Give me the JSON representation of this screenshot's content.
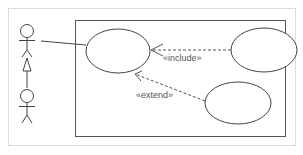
{
  "diagram": {
    "type": "uml-use-case",
    "colors": {
      "background": "#ffffff",
      "outer_frame": "#dcdcdc",
      "system_boundary": "#555555",
      "stroke": "#444444",
      "dashed": "#555555",
      "label_text": "#555555"
    },
    "actors": [
      {
        "id": "actor-1",
        "name": ""
      },
      {
        "id": "actor-2",
        "name": ""
      }
    ],
    "use_cases": [
      {
        "id": "use-case-1",
        "name": ""
      },
      {
        "id": "use-case-2",
        "name": ""
      },
      {
        "id": "use-case-3",
        "name": ""
      }
    ],
    "relationships": [
      {
        "type": "generalization",
        "from": "actor-2",
        "to": "actor-1"
      },
      {
        "type": "association",
        "from": "actor-1",
        "to": "use-case-1"
      },
      {
        "type": "include",
        "from": "use-case-2",
        "to": "use-case-1",
        "label": "«include»"
      },
      {
        "type": "extend",
        "from": "use-case-3",
        "to": "use-case-1",
        "label": "«extend»"
      }
    ],
    "labels": {
      "include": "«include»",
      "extend": "«extend»"
    }
  }
}
